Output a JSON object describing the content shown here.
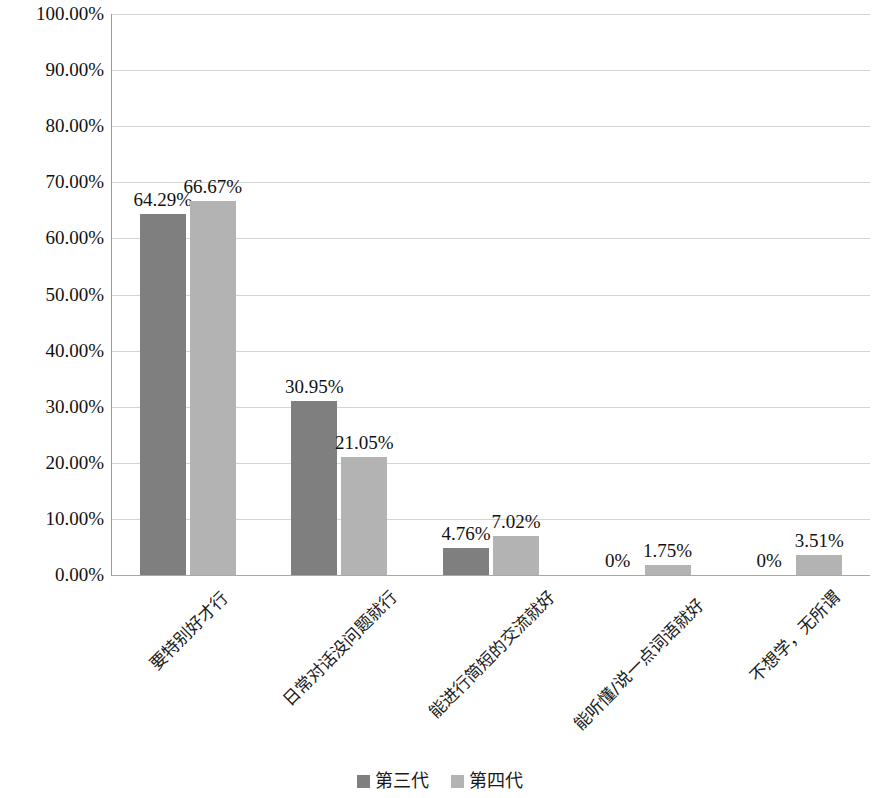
{
  "chart_data": {
    "type": "bar",
    "title": "",
    "subtitle": "",
    "xlabel": "",
    "ylabel": "",
    "grid": true,
    "legend_position": "bottom",
    "ylim": [
      0,
      100
    ],
    "ytick_labels": [
      "100.00%",
      "90.00%",
      "80.00%",
      "70.00%",
      "60.00%",
      "50.00%",
      "40.00%",
      "30.00%",
      "20.00%",
      "10.00%",
      "0.00%"
    ],
    "ytick_values": [
      100,
      90,
      80,
      70,
      60,
      50,
      40,
      30,
      20,
      10,
      0
    ],
    "categories": [
      "要特别好才行",
      "日常对话没问题就行",
      "能进行简短的交流就好",
      "能听懂/说一点词语就好",
      "不想学，无所谓"
    ],
    "series": [
      {
        "name": "第三代",
        "color": "#7f7f7f",
        "values": [
          64.29,
          30.95,
          4.76,
          0,
          0
        ],
        "labels": [
          "64.29%",
          "30.95%",
          "4.76%",
          "0%",
          "0%"
        ]
      },
      {
        "name": "第四代",
        "color": "#b3b3b3",
        "values": [
          66.67,
          21.05,
          7.02,
          1.75,
          3.51
        ],
        "labels": [
          "66.67%",
          "21.05%",
          "7.02%",
          "1.75%",
          "3.51%"
        ]
      }
    ]
  }
}
